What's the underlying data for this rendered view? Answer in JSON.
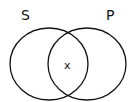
{
  "diagram": {
    "type": "venn",
    "sets": [
      {
        "label": "S"
      },
      {
        "label": "P"
      }
    ],
    "intersection_mark": "x",
    "colors": {
      "stroke": "#111111",
      "background": "#ffffff"
    }
  }
}
